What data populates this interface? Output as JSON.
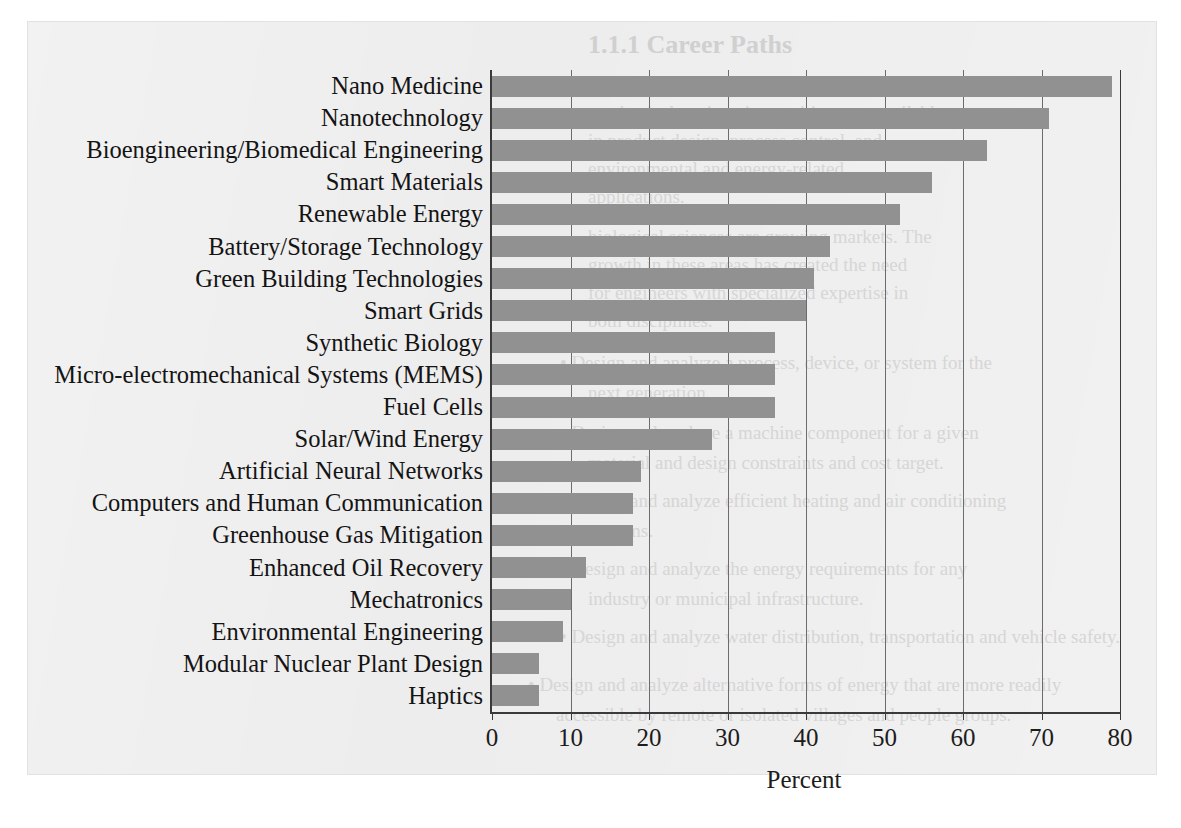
{
  "page": {
    "background_color": "#ececec",
    "ghost_text": [
      {
        "text": "1.1.1 Career Paths",
        "x": 560,
        "y": 8,
        "class": "hd"
      },
      {
        "text": "industries. Some chemical engineering and",
        "x": 560,
        "y": 52,
        "class": "bd"
      },
      {
        "text": "mechanical engineering positions are available",
        "x": 560,
        "y": 80,
        "class": "bd"
      },
      {
        "text": "in product design, process control, and",
        "x": 560,
        "y": 108,
        "class": "bd"
      },
      {
        "text": "environmental and energy-related",
        "x": 560,
        "y": 136,
        "class": "bd"
      },
      {
        "text": "applications.",
        "x": 560,
        "y": 164,
        "class": "bd"
      },
      {
        "text": "biological sciences are growing markets. The",
        "x": 560,
        "y": 204,
        "class": "bd"
      },
      {
        "text": "growth in these areas has created the need",
        "x": 560,
        "y": 232,
        "class": "bd"
      },
      {
        "text": "for engineers with specialized expertise in",
        "x": 560,
        "y": 260,
        "class": "bd"
      },
      {
        "text": "both disciplines.",
        "x": 560,
        "y": 288,
        "class": "bd"
      },
      {
        "text": "•  Design and analyze a process, device, or system for the",
        "x": 532,
        "y": 330,
        "class": "bu"
      },
      {
        "text": "next generation.",
        "x": 560,
        "y": 360,
        "class": "bu"
      },
      {
        "text": "•  Design and analyze a machine component for a given",
        "x": 532,
        "y": 400,
        "class": "bu"
      },
      {
        "text": "material and design constraints and cost target.",
        "x": 560,
        "y": 430,
        "class": "bu"
      },
      {
        "text": "•  Design and analyze efficient heating and air conditioning",
        "x": 532,
        "y": 468,
        "class": "bu"
      },
      {
        "text": "systems.",
        "x": 560,
        "y": 498,
        "class": "bu"
      },
      {
        "text": "•  Design and analyze the energy requirements for any",
        "x": 532,
        "y": 536,
        "class": "bu"
      },
      {
        "text": "industry or municipal infrastructure.",
        "x": 560,
        "y": 566,
        "class": "bu"
      },
      {
        "text": "•  Design and analyze water distribution, transportation and vehicle safety.",
        "x": 532,
        "y": 604,
        "class": "bu"
      },
      {
        "text": "•  Design and analyze alternative forms of energy that are more readily",
        "x": 500,
        "y": 652,
        "class": "bu"
      },
      {
        "text": "accessible by remote or isolated villages and people groups.",
        "x": 528,
        "y": 682,
        "class": "bu"
      }
    ]
  },
  "chart_data": {
    "type": "bar",
    "orientation": "horizontal",
    "title": "",
    "xlabel": "Percent",
    "ylabel": "",
    "xlim": [
      0,
      80
    ],
    "xticks": [
      0,
      10,
      20,
      30,
      40,
      50,
      60,
      70,
      80
    ],
    "xtick_labels": [
      "0",
      "10",
      "20",
      "30",
      "40",
      "50",
      "60",
      "70",
      "80"
    ],
    "grid": "vertical",
    "legend": "none",
    "bar_color": "#919191",
    "axis_color": "#3a3a3a",
    "grid_color": "#6c6c6c",
    "categories": [
      "Nano Medicine",
      "Nanotechnology",
      "Bioengineering/Biomedical Engineering",
      "Smart Materials",
      "Renewable Energy",
      "Battery/Storage Technology",
      "Green Building Technologies",
      "Smart Grids",
      "Synthetic Biology",
      "Micro-electromechanical Systems (MEMS)",
      "Fuel Cells",
      "Solar/Wind Energy",
      "Artificial Neural Networks",
      "Computers and Human Communication",
      "Greenhouse Gas Mitigation",
      "Enhanced Oil Recovery",
      "Mechatronics",
      "Environmental Engineering",
      "Modular Nuclear Plant Design",
      "Haptics"
    ],
    "values": [
      79,
      71,
      63,
      56,
      52,
      43,
      41,
      40,
      36,
      36,
      36,
      28,
      19,
      18,
      18,
      12,
      10,
      9,
      6,
      6
    ]
  }
}
